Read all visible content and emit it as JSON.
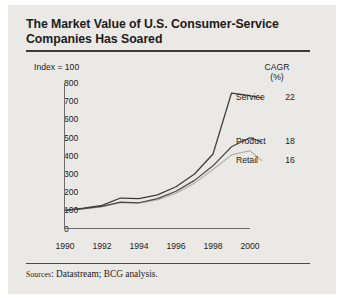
{
  "title": "The Market Value of U.S. Consumer-Service\nCompanies Has Soared",
  "axis_note": "Index = 100",
  "cagr_header_line1": "CAGR",
  "cagr_header_line2": "(%)",
  "source_prefix": "Sources",
  "source_text": ": Datastream; BCG analysis.",
  "colors": {
    "panel": "#ebe9e5",
    "title": "#1b1b1b",
    "rule": "#3a3a3a",
    "axis": "#6d6d6d",
    "service": "#3c3c3c",
    "product": "#4a4a4a",
    "retail": "#b2b2b2"
  },
  "chart_data": {
    "type": "line",
    "title": "The Market Value of U.S. Consumer-Service Companies Has Soared",
    "xlabel": "",
    "ylabel": "Index = 100",
    "xlim": [
      1990,
      2000
    ],
    "ylim": [
      0,
      800
    ],
    "yticks": [
      0,
      100,
      200,
      300,
      400,
      500,
      600,
      700,
      800
    ],
    "xticks": [
      1990,
      1992,
      1994,
      1996,
      1998,
      2000
    ],
    "xtick_labels": [
      "1990",
      "1992",
      "1994",
      "1996",
      "1998",
      "2000"
    ],
    "ytick_labels": [
      "0",
      "100",
      "200",
      "300",
      "400",
      "500",
      "600",
      "700",
      "800"
    ],
    "grid": false,
    "legend": "right-leader-lines",
    "x": [
      1990,
      1991,
      1992,
      1993,
      1994,
      1995,
      1996,
      1997,
      1998,
      1999,
      2000
    ],
    "series": [
      {
        "name": "Service",
        "cagr": 22,
        "color": "#3c3c3c",
        "values": [
          100,
          112,
          128,
          168,
          165,
          185,
          230,
          300,
          410,
          745,
          730
        ]
      },
      {
        "name": "Product",
        "cagr": 18,
        "color": "#4a4a4a",
        "values": [
          100,
          110,
          122,
          145,
          142,
          165,
          205,
          265,
          345,
          450,
          500
        ]
      },
      {
        "name": "Retail",
        "cagr": 16,
        "color": "#b2b2b2",
        "values": [
          100,
          108,
          120,
          143,
          140,
          158,
          195,
          250,
          325,
          405,
          428
        ]
      }
    ],
    "annotations": [
      {
        "text": "Service",
        "value": "22"
      },
      {
        "text": "Product",
        "value": "18"
      },
      {
        "text": "Retail",
        "value": "16"
      }
    ]
  }
}
